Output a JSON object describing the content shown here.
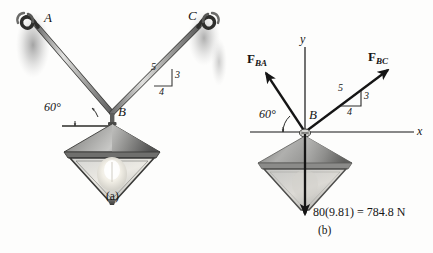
{
  "figure": {
    "background_color": "#fdfdfc",
    "ink_color": "#151515"
  },
  "panel_a": {
    "caption": "(a)",
    "point_a_label": "A",
    "point_b_label": "B",
    "point_c_label": "C",
    "angle_label": "60°",
    "slope_triangle": {
      "hypotenuse": "5",
      "vertical": "3",
      "horizontal": "4"
    }
  },
  "panel_b": {
    "caption": "(b)",
    "point_b_label": "B",
    "axis_x_label": "x",
    "axis_y_label": "y",
    "angle_label": "60°",
    "force_ba": {
      "symbol": "F",
      "subscript": "BA"
    },
    "force_bc": {
      "symbol": "F",
      "subscript": "BC"
    },
    "slope_triangle": {
      "hypotenuse": "5",
      "vertical": "3",
      "horizontal": "4"
    },
    "weight_label": "80(9.81) = 784.8 N"
  }
}
